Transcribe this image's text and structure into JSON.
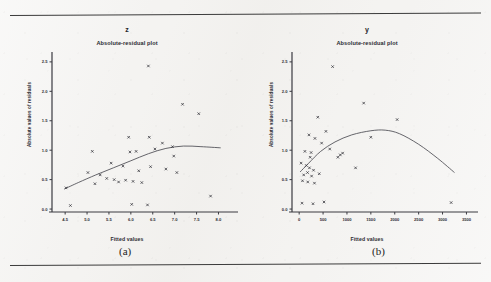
{
  "figure": {
    "caption_a": "(a)",
    "caption_b": "(b)"
  },
  "panels": [
    {
      "id": "left",
      "title": "z",
      "subtitle": "Absolute-residual plot",
      "xlabel": "Fitted values",
      "ylabel": "Absolute values of residuals",
      "caption": "(a)"
    },
    {
      "id": "right",
      "title": "y",
      "subtitle": "Absolute-residual plot",
      "xlabel": "Fitted values",
      "ylabel": "Absolute values of residuals",
      "caption": "(b)"
    }
  ],
  "chart_data": [
    {
      "type": "scatter",
      "id": "panel-a-z",
      "title": "z",
      "subtitle": "Absolute-residual plot",
      "xlabel": "Fitted values",
      "ylabel": "Absolute values of residuals",
      "xlim": [
        4.2,
        8.4
      ],
      "ylim": [
        -0.05,
        2.6
      ],
      "xticks": [
        4.5,
        5.0,
        5.5,
        6.0,
        6.5,
        7.0,
        7.5,
        8.0
      ],
      "xtick_labels": [
        "4.5",
        "5.0",
        "5.5",
        "6.0",
        "6.5",
        "7.0",
        "7.5",
        "8.0"
      ],
      "yticks": [
        0.0,
        0.5,
        1.0,
        1.5,
        2.0,
        2.5
      ],
      "ytick_labels": [
        "0.0",
        "0.5",
        "1.0",
        "1.5",
        "2.0",
        "2.5"
      ],
      "grid": false,
      "legend": null,
      "marker": "x",
      "points": [
        {
          "x": 6.4,
          "y": 2.43
        },
        {
          "x": 7.18,
          "y": 1.78
        },
        {
          "x": 7.55,
          "y": 1.62
        },
        {
          "x": 5.95,
          "y": 1.22
        },
        {
          "x": 6.42,
          "y": 1.22
        },
        {
          "x": 5.12,
          "y": 0.98
        },
        {
          "x": 5.98,
          "y": 0.97
        },
        {
          "x": 4.52,
          "y": 0.36
        },
        {
          "x": 5.02,
          "y": 0.62
        },
        {
          "x": 5.55,
          "y": 0.78
        },
        {
          "x": 5.82,
          "y": 0.73
        },
        {
          "x": 6.12,
          "y": 0.98
        },
        {
          "x": 6.55,
          "y": 1.02
        },
        {
          "x": 6.72,
          "y": 1.12
        },
        {
          "x": 6.95,
          "y": 1.06
        },
        {
          "x": 5.3,
          "y": 0.58
        },
        {
          "x": 5.45,
          "y": 0.52
        },
        {
          "x": 5.62,
          "y": 0.5
        },
        {
          "x": 5.72,
          "y": 0.46
        },
        {
          "x": 5.88,
          "y": 0.49
        },
        {
          "x": 6.05,
          "y": 0.47
        },
        {
          "x": 6.25,
          "y": 0.45
        },
        {
          "x": 6.45,
          "y": 0.72
        },
        {
          "x": 6.8,
          "y": 0.68
        },
        {
          "x": 7.05,
          "y": 0.62
        },
        {
          "x": 6.18,
          "y": 0.65
        },
        {
          "x": 4.62,
          "y": 0.06
        },
        {
          "x": 6.02,
          "y": 0.08
        },
        {
          "x": 6.38,
          "y": 0.07
        },
        {
          "x": 7.82,
          "y": 0.22
        },
        {
          "x": 6.98,
          "y": 0.9
        },
        {
          "x": 5.18,
          "y": 0.43
        }
      ],
      "smoother": {
        "name": "lowess",
        "points": [
          {
            "x": 4.48,
            "y": 0.34
          },
          {
            "x": 4.8,
            "y": 0.45
          },
          {
            "x": 5.2,
            "y": 0.58
          },
          {
            "x": 5.6,
            "y": 0.7
          },
          {
            "x": 6.0,
            "y": 0.82
          },
          {
            "x": 6.4,
            "y": 0.94
          },
          {
            "x": 6.8,
            "y": 1.03
          },
          {
            "x": 7.2,
            "y": 1.07
          },
          {
            "x": 7.6,
            "y": 1.06
          },
          {
            "x": 8.05,
            "y": 1.04
          }
        ]
      }
    },
    {
      "type": "scatter",
      "id": "panel-b-y",
      "title": "y",
      "subtitle": "Absolute-residual plot",
      "xlabel": "Fitted values",
      "ylabel": "Absolute values of residuals",
      "xlim": [
        -150,
        3700
      ],
      "ylim": [
        -0.05,
        2.6
      ],
      "xticks": [
        0,
        500,
        1000,
        1500,
        2000,
        2500,
        3000,
        3500
      ],
      "xtick_labels": [
        "0",
        "500",
        "1000",
        "1500",
        "2000",
        "2500",
        "3000",
        "3500"
      ],
      "yticks": [
        0.0,
        0.5,
        1.0,
        1.5,
        2.0,
        2.5
      ],
      "ytick_labels": [
        "0.0",
        "0.5",
        "1.0",
        "1.5",
        "2.0",
        "2.5"
      ],
      "grid": false,
      "legend": null,
      "marker": "x",
      "points": [
        {
          "x": 700,
          "y": 2.42
        },
        {
          "x": 1350,
          "y": 1.8
        },
        {
          "x": 2050,
          "y": 1.52
        },
        {
          "x": 390,
          "y": 1.56
        },
        {
          "x": 560,
          "y": 1.32
        },
        {
          "x": 205,
          "y": 1.26
        },
        {
          "x": 330,
          "y": 1.2
        },
        {
          "x": 470,
          "y": 1.12
        },
        {
          "x": 1500,
          "y": 1.22
        },
        {
          "x": 120,
          "y": 0.98
        },
        {
          "x": 250,
          "y": 0.96
        },
        {
          "x": 640,
          "y": 1.02
        },
        {
          "x": 860,
          "y": 0.92
        },
        {
          "x": 910,
          "y": 0.95
        },
        {
          "x": 40,
          "y": 0.78
        },
        {
          "x": 150,
          "y": 0.74
        },
        {
          "x": 215,
          "y": 0.7
        },
        {
          "x": 300,
          "y": 0.66
        },
        {
          "x": 175,
          "y": 0.62
        },
        {
          "x": 95,
          "y": 0.58
        },
        {
          "x": 260,
          "y": 0.56
        },
        {
          "x": 420,
          "y": 0.6
        },
        {
          "x": 1180,
          "y": 0.7
        },
        {
          "x": 70,
          "y": 0.48
        },
        {
          "x": 180,
          "y": 0.46
        },
        {
          "x": 320,
          "y": 0.44
        },
        {
          "x": 60,
          "y": 0.1
        },
        {
          "x": 290,
          "y": 0.09
        },
        {
          "x": 520,
          "y": 0.12
        },
        {
          "x": 3180,
          "y": 0.11
        },
        {
          "x": 810,
          "y": 0.88
        },
        {
          "x": 230,
          "y": 0.88
        }
      ],
      "smoother": {
        "name": "lowess",
        "points": [
          {
            "x": 20,
            "y": 0.63
          },
          {
            "x": 200,
            "y": 0.78
          },
          {
            "x": 450,
            "y": 0.98
          },
          {
            "x": 750,
            "y": 1.14
          },
          {
            "x": 1100,
            "y": 1.26
          },
          {
            "x": 1500,
            "y": 1.33
          },
          {
            "x": 1800,
            "y": 1.34
          },
          {
            "x": 2100,
            "y": 1.28
          },
          {
            "x": 2500,
            "y": 1.1
          },
          {
            "x": 2900,
            "y": 0.86
          },
          {
            "x": 3250,
            "y": 0.62
          }
        ]
      }
    }
  ]
}
